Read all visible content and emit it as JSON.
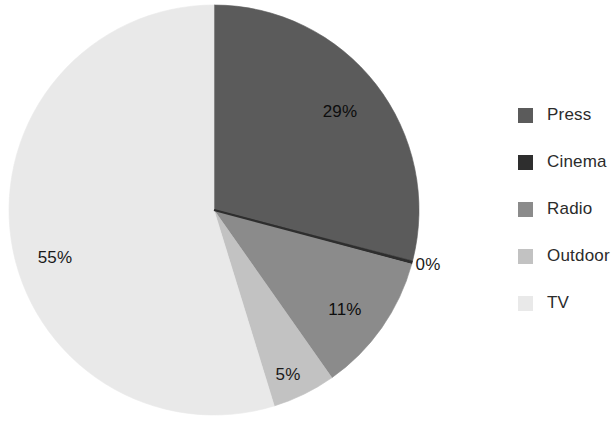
{
  "chart_data": {
    "type": "pie",
    "title": "",
    "subtitle": "",
    "xlabel": "",
    "ylabel": "",
    "legend_position": "right",
    "grid": false,
    "start_angle_deg": 0,
    "direction": "clockwise",
    "center": {
      "x": 214,
      "y": 210
    },
    "radius": 205,
    "categories": [
      "Press",
      "Cinema",
      "Radio",
      "Outdoor",
      "TV"
    ],
    "values": [
      29,
      0,
      11,
      5,
      55
    ],
    "value_labels": [
      "29%",
      "0%",
      "11%",
      "5%",
      "55%"
    ],
    "colors": [
      "#5b5b5b",
      "#2e2e2e",
      "#8b8b8b",
      "#c2c2c2",
      "#e9e9e9"
    ],
    "slices": [
      {
        "name": "Press",
        "value": 29,
        "label": "29%",
        "color": "#5b5b5b",
        "start_deg": 0,
        "end_deg": 104.4,
        "label_x": 340,
        "label_y": 112,
        "label_on_dark": true
      },
      {
        "name": "Cinema",
        "value": 0,
        "label": "0%",
        "color": "#2e2e2e",
        "start_deg": 104.4,
        "end_deg": 105.3,
        "label_x": 428,
        "label_y": 265,
        "label_on_dark": false
      },
      {
        "name": "Radio",
        "value": 11,
        "label": "11%",
        "color": "#8b8b8b",
        "start_deg": 105.3,
        "end_deg": 144.9,
        "label_x": 345,
        "label_y": 310,
        "label_on_dark": true
      },
      {
        "name": "Outdoor",
        "value": 5,
        "label": "5%",
        "color": "#c2c2c2",
        "start_deg": 144.9,
        "end_deg": 162.9,
        "label_x": 288,
        "label_y": 375,
        "label_on_dark": false
      },
      {
        "name": "TV",
        "value": 55,
        "label": "55%",
        "color": "#e9e9e9",
        "start_deg": 162.9,
        "end_deg": 360,
        "label_x": 55,
        "label_y": 258,
        "label_on_dark": false
      }
    ]
  },
  "legend": {
    "items": [
      {
        "label": "Press",
        "color": "#5b5b5b"
      },
      {
        "label": "Cinema",
        "color": "#2e2e2e"
      },
      {
        "label": "Radio",
        "color": "#8b8b8b"
      },
      {
        "label": "Outdoor",
        "color": "#c2c2c2"
      },
      {
        "label": "TV",
        "color": "#e9e9e9"
      }
    ]
  }
}
